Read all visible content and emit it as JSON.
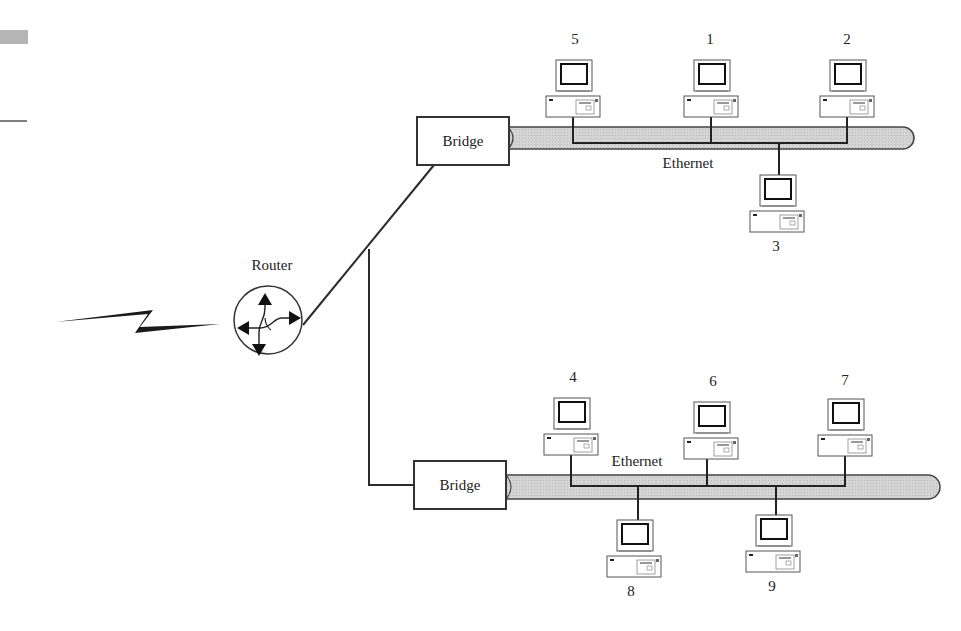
{
  "diagram": {
    "type": "network-topology",
    "router": {
      "label": "Router",
      "x": 268,
      "y": 320
    },
    "wan_link": {
      "kind": "lightning-bolt"
    },
    "bridges": [
      {
        "id": "bridge-top",
        "label": "Bridge",
        "x": 416,
        "y": 116,
        "w": 94,
        "h": 50
      },
      {
        "id": "bridge-bottom",
        "label": "Bridge",
        "x": 413,
        "y": 460,
        "w": 94,
        "h": 50
      }
    ],
    "segments": [
      {
        "id": "ethernet-top",
        "label": "Ethernet",
        "label_x": 688,
        "label_y": 155
      },
      {
        "id": "ethernet-bottom",
        "label": "Ethernet",
        "label_x": 637,
        "label_y": 456
      }
    ],
    "computers": [
      {
        "id": "5",
        "label": "5",
        "x": 573,
        "y": 60,
        "label_y": 32,
        "side": "top",
        "segment": "ethernet-top"
      },
      {
        "id": "1",
        "label": "1",
        "x": 711,
        "y": 60,
        "label_y": 32,
        "side": "top",
        "segment": "ethernet-top"
      },
      {
        "id": "2",
        "label": "2",
        "x": 847,
        "y": 60,
        "label_y": 32,
        "side": "top",
        "segment": "ethernet-top"
      },
      {
        "id": "3",
        "label": "3",
        "x": 777,
        "y": 175,
        "label_y": 238,
        "side": "bottom",
        "segment": "ethernet-top"
      },
      {
        "id": "4",
        "label": "4",
        "x": 571,
        "y": 398,
        "label_y": 370,
        "side": "top",
        "segment": "ethernet-bottom"
      },
      {
        "id": "6",
        "label": "6",
        "x": 711,
        "y": 402,
        "label_y": 374,
        "side": "top",
        "segment": "ethernet-bottom"
      },
      {
        "id": "7",
        "label": "7",
        "x": 845,
        "y": 399,
        "label_y": 373,
        "side": "top",
        "segment": "ethernet-bottom"
      },
      {
        "id": "8",
        "label": "8",
        "x": 632,
        "y": 520,
        "label_y": 583,
        "side": "bottom",
        "segment": "ethernet-bottom"
      },
      {
        "id": "9",
        "label": "9",
        "x": 770,
        "y": 515,
        "label_y": 578,
        "side": "bottom",
        "segment": "ethernet-bottom"
      }
    ]
  },
  "labels": {
    "router": "Router",
    "bridge_top": "Bridge",
    "bridge_bottom": "Bridge",
    "ethernet_top": "Ethernet",
    "ethernet_bottom": "Ethernet",
    "pc1": "1",
    "pc2": "2",
    "pc3": "3",
    "pc4": "4",
    "pc5": "5",
    "pc6": "6",
    "pc7": "7",
    "pc8": "8",
    "pc9": "9"
  },
  "colors": {
    "line": "#2b2b2b",
    "cable_fill": "#cfcfcf",
    "cable_stroke": "#444444",
    "margin_mark": "#b5b5b5"
  }
}
